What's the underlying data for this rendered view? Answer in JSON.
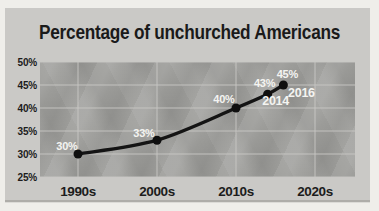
{
  "title": "Percentage of unchurched Americans",
  "chart_data": {
    "type": "line",
    "title": "Percentage of unchurched Americans",
    "xlabel": "",
    "ylabel": "",
    "categories": [
      "1990s",
      "2000s",
      "2010s",
      "2020s"
    ],
    "y_ticks": [
      "50%",
      "45%",
      "40%",
      "35%",
      "30%",
      "25%"
    ],
    "ylim": [
      25,
      50
    ],
    "grid": true,
    "legend": false,
    "points": [
      {
        "x": "1990s",
        "value": 30,
        "label": "30%"
      },
      {
        "x": "2000s",
        "value": 33,
        "label": "33%"
      },
      {
        "x": "2010s",
        "value": 40,
        "label": "40%"
      },
      {
        "x": "2014",
        "value": 43,
        "label": "43%",
        "annotation": "2014"
      },
      {
        "x": "2016",
        "value": 45,
        "label": "45%",
        "annotation": "2016"
      }
    ],
    "colors": {
      "page_bg": "#efeeea",
      "card_bg": "#cac9c6",
      "plot_bg": "#9d9d9a",
      "gridline": "#c9c8c5",
      "line": "#141414",
      "point": "#0f0f0f",
      "value_label_text": "#f4f4f1",
      "axis_text": "#1c1c1c",
      "title_text": "#1a1a1a"
    }
  }
}
